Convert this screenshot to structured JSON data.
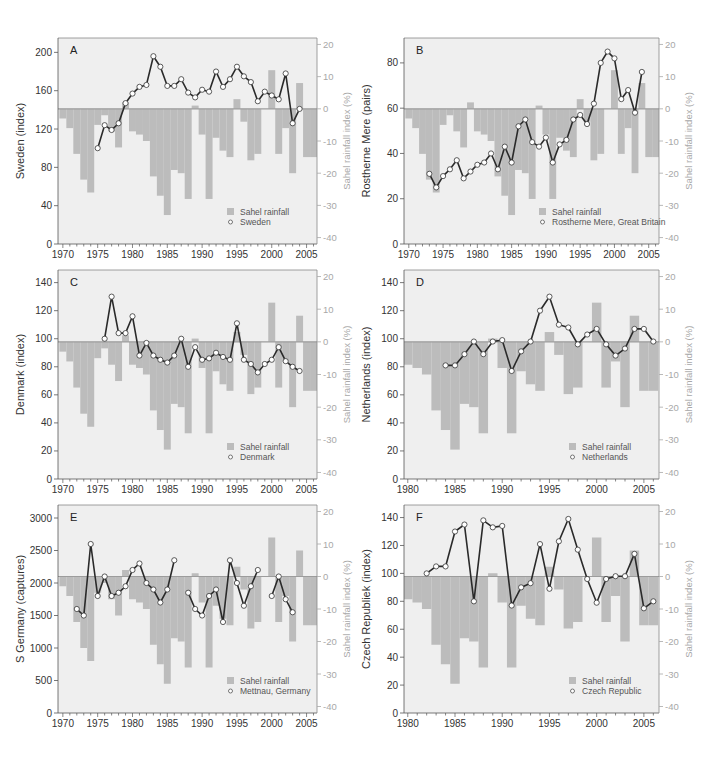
{
  "figure": {
    "legend_bar_label": "Sahel rainfall",
    "right_axis_label": "Sahel rainfall index (%)",
    "colors": {
      "plot_bg": "#efefef",
      "bar": "#bcbcbc",
      "zero_line": "#9c9c9c",
      "line": "#2a2a2a",
      "marker_fill": "#ffffff",
      "axis": "#555555",
      "right_axis": "#a8a8a8"
    }
  },
  "chart_data": [
    {
      "panel": "A",
      "type": "bar+line",
      "title": "A",
      "xlabel": "",
      "ylabel": "Sweden (index)",
      "ylabel_right": "Sahel rainfall index (%)",
      "ylim": [
        0,
        215
      ],
      "yticks": [
        0,
        40,
        80,
        120,
        160,
        200
      ],
      "ylim_right": [
        -42,
        22
      ],
      "yticks_right": [
        -40,
        -30,
        -20,
        -10,
        0,
        10,
        20
      ],
      "xlim": [
        1969.3,
        2006.5
      ],
      "xticks": [
        1970,
        1975,
        1980,
        1985,
        1990,
        1995,
        2000,
        2005
      ],
      "legend": [
        "Sahel rainfall",
        "Sweden"
      ],
      "legend_position": "lower right",
      "series": [
        {
          "name": "Sweden",
          "type": "line",
          "x": [
            1975,
            1976,
            1977,
            1978,
            1979,
            1980,
            1981,
            1982,
            1983,
            1984,
            1985,
            1986,
            1987,
            1988,
            1989,
            1990,
            1991,
            1992,
            1993,
            1994,
            1995,
            1996,
            1997,
            1998,
            1999,
            2000,
            2001,
            2002,
            2003,
            2004
          ],
          "y": [
            100,
            124,
            119,
            126,
            147,
            157,
            164,
            166,
            196,
            185,
            165,
            165,
            172,
            158,
            153,
            161,
            159,
            180,
            164,
            172,
            185,
            175,
            169,
            149,
            159,
            155,
            151,
            178,
            126,
            141
          ]
        }
      ]
    },
    {
      "panel": "B",
      "type": "bar+line",
      "title": "B",
      "ylabel": "Rostherne Mere (pairs)",
      "ylabel_right": "Sahel rainfall index (%)",
      "ylim": [
        0,
        91
      ],
      "yticks": [
        0,
        20,
        40,
        60,
        80
      ],
      "ylim_right": [
        -42,
        22
      ],
      "yticks_right": [
        -40,
        -30,
        -20,
        -10,
        0,
        10,
        20
      ],
      "xlim": [
        1969.3,
        2006.5
      ],
      "xticks": [
        1970,
        1975,
        1980,
        1985,
        1990,
        1995,
        2000,
        2005
      ],
      "legend": [
        "Sahel rainfall",
        "Rostherne Mere, Great Britain"
      ],
      "legend_position": "lower right",
      "series": [
        {
          "name": "Rostherne Mere, Great Britain",
          "type": "line",
          "x": [
            1973,
            1974,
            1975,
            1976,
            1977,
            1978,
            1979,
            1980,
            1981,
            1982,
            1983,
            1984,
            1985,
            1986,
            1987,
            1988,
            1989,
            1990,
            1991,
            1992,
            1993,
            1994,
            1995,
            1996,
            1997,
            1998,
            1999,
            2000,
            2001,
            2002,
            2003,
            2004
          ],
          "y": [
            31,
            25,
            30,
            33,
            37,
            29,
            32,
            35,
            36,
            40,
            33,
            43,
            36,
            52,
            55,
            45,
            43,
            47,
            36,
            44,
            46,
            55,
            57,
            53,
            62,
            80,
            85,
            82,
            64,
            68,
            58,
            76
          ]
        }
      ]
    },
    {
      "panel": "C",
      "type": "bar+line",
      "title": "C",
      "ylabel": "Denmark (index)",
      "ylabel_right": "Sahel rainfall index (%)",
      "ylim": [
        0,
        149
      ],
      "yticks": [
        0,
        20,
        40,
        60,
        80,
        100,
        120,
        140
      ],
      "ylim_right": [
        -42,
        22
      ],
      "yticks_right": [
        -40,
        -30,
        -20,
        -10,
        0,
        10,
        20
      ],
      "xlim": [
        1969.3,
        2006.5
      ],
      "xticks": [
        1970,
        1975,
        1980,
        1985,
        1990,
        1995,
        2000,
        2005
      ],
      "legend": [
        "Sahel rainfall",
        "Denmark"
      ],
      "legend_position": "lower right",
      "series": [
        {
          "name": "Denmark",
          "type": "line",
          "x": [
            1976,
            1977,
            1978,
            1979,
            1980,
            1981,
            1982,
            1983,
            1984,
            1985,
            1986,
            1987,
            1988,
            1989,
            1990,
            1991,
            1992,
            1993,
            1994,
            1995,
            1996,
            1997,
            1998,
            1999,
            2000,
            2001,
            2002,
            2003,
            2004
          ],
          "y": [
            100,
            130,
            104,
            104,
            116,
            88,
            97,
            88,
            85,
            83,
            88,
            100,
            80,
            94,
            85,
            86,
            90,
            87,
            85,
            111,
            85,
            82,
            76,
            82,
            85,
            94,
            84,
            80,
            77
          ]
        }
      ]
    },
    {
      "panel": "D",
      "type": "bar+line",
      "title": "D",
      "ylabel": "Netherlands (index)",
      "ylabel_right": "Sahel rainfall index (%)",
      "ylim": [
        0,
        149
      ],
      "yticks": [
        0,
        20,
        40,
        60,
        80,
        100,
        120,
        140
      ],
      "ylim_right": [
        -42,
        22
      ],
      "yticks_right": [
        -40,
        -30,
        -20,
        -10,
        0,
        10,
        20
      ],
      "xlim": [
        1979.6,
        2006.6
      ],
      "xticks": [
        1980,
        1985,
        1990,
        1995,
        2000,
        2005
      ],
      "legend": [
        "Sahel rainfall",
        "Netherlands"
      ],
      "legend_position": "lower right",
      "series": [
        {
          "name": "Netherlands",
          "type": "line",
          "x": [
            1984,
            1985,
            1986,
            1987,
            1988,
            1989,
            1990,
            1991,
            1992,
            1993,
            1994,
            1995,
            1996,
            1997,
            1998,
            1999,
            2000,
            2001,
            2002,
            2003,
            2004,
            2005,
            2006
          ],
          "y": [
            81,
            81,
            89,
            98,
            89,
            98,
            99,
            77,
            91,
            98,
            120,
            130,
            110,
            108,
            96,
            103,
            107,
            96,
            88,
            93,
            107,
            107,
            98
          ]
        }
      ]
    },
    {
      "panel": "E",
      "type": "bar+line",
      "title": "E",
      "ylabel": "S Germany (captures)",
      "ylabel_right": "Sahel rainfall index (%)",
      "ylim": [
        0,
        3200
      ],
      "yticks": [
        0,
        500,
        1000,
        1500,
        2000,
        2500,
        3000
      ],
      "ylim_right": [
        -42,
        22
      ],
      "yticks_right": [
        -40,
        -30,
        -20,
        -10,
        0,
        10,
        20
      ],
      "xlim": [
        1969.3,
        2006.5
      ],
      "xticks": [
        1970,
        1975,
        1980,
        1985,
        1990,
        1995,
        2000,
        2005
      ],
      "legend": [
        "Sahel rainfall",
        "Mettnau, Germany"
      ],
      "legend_position": "lower right",
      "series": [
        {
          "name": "Mettnau, Germany",
          "type": "line",
          "segments": [
            {
              "x": [
                1972,
                1973,
                1974,
                1975,
                1976,
                1977,
                1978,
                1979,
                1980,
                1981,
                1982,
                1983,
                1984,
                1985,
                1986
              ],
              "y": [
                1600,
                1500,
                2600,
                1800,
                2100,
                1800,
                1850,
                1950,
                2200,
                2300,
                2000,
                1900,
                1700,
                1900,
                2350
              ]
            },
            {
              "x": [
                1988,
                1989,
                1990,
                1991,
                1992,
                1993,
                1994,
                1995,
                1996,
                1997,
                1998
              ],
              "y": [
                1850,
                1600,
                1500,
                1800,
                1900,
                1400,
                2350,
                2000,
                1650,
                1950,
                2200
              ]
            },
            {
              "x": [
                2000,
                2001,
                2002,
                2003
              ],
              "y": [
                1800,
                2100,
                1750,
                1550
              ]
            }
          ]
        }
      ]
    },
    {
      "panel": "F",
      "type": "bar+line",
      "title": "F",
      "ylabel": "Czech Republiek (index)",
      "ylabel_right": "Sahel rainfall index (%)",
      "ylim": [
        0,
        149
      ],
      "yticks": [
        0,
        20,
        40,
        60,
        80,
        100,
        120,
        140
      ],
      "ylim_right": [
        -42,
        22
      ],
      "yticks_right": [
        -40,
        -30,
        -20,
        -10,
        0,
        10,
        20
      ],
      "xlim": [
        1979.6,
        2006.6
      ],
      "xticks": [
        1980,
        1985,
        1990,
        1995,
        2000,
        2005
      ],
      "legend": [
        "Sahel rainfall",
        "Czech Republic"
      ],
      "legend_position": "lower right",
      "series": [
        {
          "name": "Czech Republic",
          "type": "line",
          "x": [
            1982,
            1983,
            1984,
            1985,
            1986,
            1987,
            1988,
            1989,
            1990,
            1991,
            1992,
            1993,
            1994,
            1995,
            1996,
            1997,
            1998,
            1999,
            2000,
            2001,
            2002,
            2003,
            2004,
            2005,
            2006
          ],
          "y": [
            100,
            105,
            105,
            130,
            135,
            80,
            138,
            133,
            134,
            77,
            90,
            93,
            121,
            89,
            123,
            139,
            117,
            96,
            79,
            96,
            98,
            98,
            114,
            75,
            80
          ]
        }
      ]
    }
  ],
  "sahel_rainfall": {
    "name": "Sahel rainfall",
    "unit": "%",
    "years": [
      1970,
      1971,
      1972,
      1973,
      1974,
      1975,
      1976,
      1977,
      1978,
      1979,
      1980,
      1981,
      1982,
      1983,
      1984,
      1985,
      1986,
      1987,
      1988,
      1989,
      1990,
      1991,
      1992,
      1993,
      1994,
      1995,
      1996,
      1997,
      1998,
      1999,
      2000,
      2001,
      2002,
      2003,
      2004,
      2005,
      2006
    ],
    "values": [
      -3,
      -6,
      -14,
      -22,
      -26,
      -5,
      -2,
      -7,
      -12,
      2,
      -7,
      -8,
      -10,
      -21,
      -27,
      -33,
      -19,
      -20,
      -28,
      1,
      -8,
      -28,
      -9,
      -13,
      -15,
      3,
      -4,
      -16,
      -14,
      0,
      12,
      -14,
      -6,
      -20,
      8,
      -15,
      -15
    ]
  },
  "panels_layout": [
    {
      "id": "A",
      "x0": 58,
      "x1": 317,
      "y0": 38,
      "y1": 244
    },
    {
      "id": "B",
      "x0": 404,
      "x1": 659,
      "y0": 38,
      "y1": 244
    },
    {
      "id": "C",
      "x0": 58,
      "x1": 317,
      "y0": 270,
      "y1": 479
    },
    {
      "id": "D",
      "x0": 404,
      "x1": 659,
      "y0": 270,
      "y1": 479
    },
    {
      "id": "E",
      "x0": 58,
      "x1": 317,
      "y0": 505,
      "y1": 713
    },
    {
      "id": "F",
      "x0": 404,
      "x1": 659,
      "y0": 505,
      "y1": 713
    }
  ]
}
